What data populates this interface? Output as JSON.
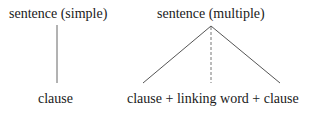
{
  "simple": {
    "root": "sentence (simple)",
    "child": "clause"
  },
  "multiple": {
    "root": "sentence (multiple)",
    "child": "clause + linking word + clause"
  },
  "colors": {
    "text": "#1a1a1a",
    "line": "#555555"
  }
}
